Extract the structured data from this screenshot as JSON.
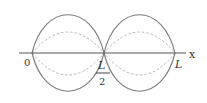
{
  "diagram": {
    "axis": {
      "label": "x",
      "color": "#555555"
    },
    "ticks": [
      {
        "label": "0"
      },
      {
        "numerator": "L",
        "denominator": "2"
      },
      {
        "label": "L"
      }
    ],
    "curves": {
      "solid": {
        "style": "solid",
        "color": "#777777",
        "description": "maximum displacement envelope"
      },
      "dashed": {
        "style": "dashed",
        "color": "#b0b0b0",
        "description": "intermediate displacement"
      }
    }
  }
}
